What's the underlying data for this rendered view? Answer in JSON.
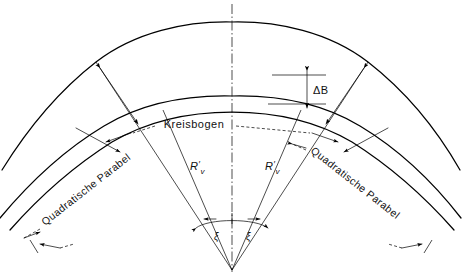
{
  "figure": {
    "kind": "engineering-diagram",
    "title_visible": false,
    "background_color": "#ffffff",
    "line_color": "#000000",
    "width": 462,
    "height": 277
  },
  "labels": {
    "arc_center": "Kreisbogen",
    "parabola_left": "Quadratische Parabel",
    "parabola_right": "Quadratische Parabel",
    "widening": "ΔB",
    "radius_left": "R",
    "radius_left_prime": "′",
    "radius_left_sub": "v",
    "radius_right": "R",
    "radius_right_prime": "′",
    "radius_right_sub": "v",
    "angle_left": "ξ",
    "angle_right": "ξ"
  },
  "icons": {
    "centerline": "dash-dot-axis-icon",
    "arrowhead": "arrowhead-icon",
    "dimension_arrow": "double-arrow-icon",
    "leader": "dashed-leader-icon"
  },
  "geometry": {
    "center_of_curvature": {
      "x": 232,
      "y": 270
    },
    "axis_x": 232,
    "curves": [
      {
        "name": "outer-edge",
        "apex_y": 22
      },
      {
        "name": "middle-edge",
        "apex_y": 96
      },
      {
        "name": "inner-edge",
        "apex_y": 112
      }
    ],
    "radial_lines": [
      {
        "name": "left-outer-radial",
        "angle_deg": 128
      },
      {
        "name": "left-inner-radial",
        "angle_deg": 108
      },
      {
        "name": "right-inner-radial",
        "angle_deg": 72
      },
      {
        "name": "right-outer-radial",
        "angle_deg": 52
      }
    ],
    "angle_dimension": {
      "arc_radius": 55,
      "symbols": 2
    },
    "widening_dimension": {
      "x": 307,
      "y_top": 75,
      "y_bottom": 104
    }
  }
}
